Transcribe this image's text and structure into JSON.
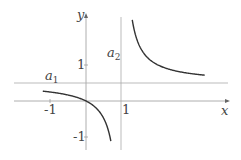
{
  "chart_data": {
    "type": "line",
    "title": "",
    "function": "y = 1/2 + 1/(2(x-1))",
    "xlabel": "x",
    "ylabel": "y",
    "x_ticks": [
      "-1",
      "1"
    ],
    "y_ticks": [
      "1",
      "-1"
    ],
    "xlim": [
      -1.2,
      3.3
    ],
    "ylim": [
      -1.3,
      2.6
    ],
    "asymptotes": [
      {
        "name": "a1",
        "type": "horizontal",
        "value": 0.5
      },
      {
        "name": "a2",
        "type": "vertical",
        "value": 1
      }
    ],
    "grid": false,
    "legend": null
  },
  "labels": {
    "x_axis": "x",
    "y_axis": "y",
    "a1_base": "a",
    "a1_sub": "1",
    "a2_base": "a",
    "a2_sub": "2",
    "tick_x_neg1": "-1",
    "tick_x_1": "1",
    "tick_y_1": "1",
    "tick_y_neg1": "-1"
  }
}
